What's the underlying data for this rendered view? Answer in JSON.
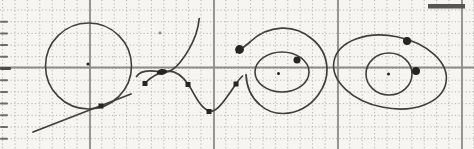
{
  "figure": {
    "width": 474,
    "height": 149,
    "background": "#f6f5f1",
    "stroke_color": "#413f3b",
    "point_color": "#262522",
    "grid": {
      "minor_color": "#b6b4b0",
      "major_color": "#8e8c88",
      "minor_spacing_x": 12.4,
      "minor_offset_x": 2.6,
      "minor_spacing_y": 11.7,
      "minor_offset_y": 10,
      "major_vertical_x": [
        90,
        214,
        338,
        462
      ],
      "major_horizontal_y": [
        67.5
      ],
      "minor_dash": "1.2 2.3"
    },
    "artifacts": {
      "top_bar": {
        "x": 428,
        "y": 4,
        "width": 37,
        "height": 4.5,
        "color": "#57554f"
      },
      "edge_dash_color": "#6e6c66",
      "edge_dash_heavy_color": "#4c4a45",
      "edge_dashes_y": [
        21.7,
        33.4,
        45.1,
        56.8,
        68.5,
        80.2,
        91.9,
        103.6,
        115.3,
        127,
        138.7
      ],
      "edge_dash_heavy_y": 68.5,
      "speck": {
        "cx": 160,
        "cy": 33,
        "r": 1.4,
        "color": "#8a8882"
      }
    },
    "shapes": [
      {
        "type": "circle",
        "name": "large-circle",
        "cx": 88.5,
        "cy": 66,
        "r": 43
      },
      {
        "type": "dot",
        "name": "large-circle-center-dot",
        "cx": 88,
        "cy": 64,
        "r": 1.6
      },
      {
        "type": "line",
        "name": "tangent-line",
        "x1": 33,
        "y1": 132,
        "x2": 131,
        "y2": 94
      },
      {
        "type": "square",
        "name": "tangent-point-marker",
        "cx": 101,
        "cy": 106,
        "s": 5
      },
      {
        "type": "path",
        "name": "hook-curve",
        "d": "M136.5,76.5 C139,72.5 143.5,71 149.5,70.9 C156,70.9 160,71.8 164,72.2 C170,72.6 175,68.5 180,62.5 C186,55 192.5,43.5 195.8,34.5 C197.5,29.5 198.8,24 199.2,18.5"
      },
      {
        "type": "path",
        "name": "spline-curve",
        "d": "M145,83 C150,78 157,72.5 167,71.3 C175,70.5 181.5,75 188,84 C193,90.5 199,107.5 209,111 C217,113.8 226,98 236,84 C238,80.5 240.5,78 242.5,76"
      },
      {
        "type": "blob",
        "name": "curve-crossing-point",
        "cx": 162,
        "cy": 72,
        "rx": 5.2,
        "ry": 2.9,
        "rot": -7
      },
      {
        "type": "square",
        "name": "spline-node-1",
        "cx": 145,
        "cy": 83.5,
        "s": 5
      },
      {
        "type": "square",
        "name": "spline-node-2",
        "cx": 188,
        "cy": 84.5,
        "s": 5
      },
      {
        "type": "square",
        "name": "spline-node-3",
        "cx": 209,
        "cy": 111.5,
        "s": 5
      },
      {
        "type": "square",
        "name": "spline-node-4",
        "cx": 236,
        "cy": 84,
        "s": 5
      },
      {
        "type": "path",
        "name": "spiral-arc",
        "d": "M246,74.5 C246.5,86 251,97 259.5,104.5 C266,110.5 274,113.5 283,113.5 C297,113.5 310,106.5 318.5,94.5 C324.5,86 327.5,78 327,68 C326.3,56.5 320.5,45.5 311.5,38.5 C302.5,31 292.5,27.6 281.5,28.2 C269.5,28.8 258.5,34 250.5,41.5 C246,45.5 240.5,49.5 236.5,52.5"
      },
      {
        "type": "dot",
        "name": "spiral-end-dot",
        "cx": 239.5,
        "cy": 49.5,
        "r": 4.4
      },
      {
        "type": "ellipse",
        "name": "inner-oval",
        "cx": 282,
        "cy": 72,
        "rx": 27,
        "ry": 20,
        "rot": 0
      },
      {
        "type": "dot",
        "name": "inner-oval-center-dot",
        "cx": 278.5,
        "cy": 73.5,
        "r": 1.5
      },
      {
        "type": "dot",
        "name": "oval-region-dot",
        "cx": 297,
        "cy": 60,
        "r": 3.5
      },
      {
        "type": "ellipse",
        "name": "tilted-ellipse",
        "cx": 390,
        "cy": 72,
        "rx": 57,
        "ry": 36,
        "rot": 11
      },
      {
        "type": "ellipse",
        "name": "ellipse-inner-circle",
        "cx": 389,
        "cy": 74,
        "rx": 23,
        "ry": 21,
        "rot": 0
      },
      {
        "type": "dot",
        "name": "ellipse-center-dot",
        "cx": 388.5,
        "cy": 74,
        "r": 1.5
      },
      {
        "type": "dot",
        "name": "ellipse-top-dot",
        "cx": 407,
        "cy": 41,
        "r": 4
      },
      {
        "type": "dot",
        "name": "ellipse-right-dot",
        "cx": 416,
        "cy": 71,
        "r": 4
      }
    ]
  }
}
